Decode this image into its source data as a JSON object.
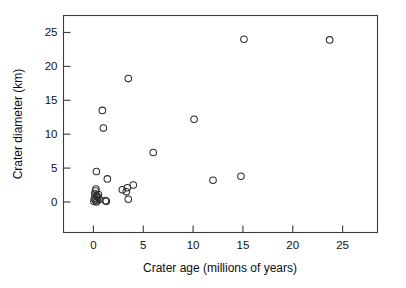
{
  "chart_data": {
    "type": "scatter",
    "title": "",
    "xlabel": "Crater age (millions of years)",
    "ylabel": "Crater diameter (km)",
    "xlim": [
      -3,
      28.5
    ],
    "ylim": [
      -4.5,
      27.5
    ],
    "xticks": [
      0,
      5,
      10,
      15,
      20,
      25
    ],
    "yticks": [
      0,
      5,
      10,
      15,
      20,
      25
    ],
    "xtick_labels": [
      "0",
      "5",
      "10",
      "15",
      "20",
      "25"
    ],
    "ytick_labels": [
      "0",
      "5",
      "10",
      "15",
      "20",
      "25"
    ],
    "grid": false,
    "legend": null,
    "marker": "open-circle",
    "series": [
      {
        "name": "craters",
        "points": [
          {
            "x": 15.1,
            "y": 24.0
          },
          {
            "x": 23.7,
            "y": 23.9
          },
          {
            "x": 3.5,
            "y": 18.2
          },
          {
            "x": 0.9,
            "y": 13.5
          },
          {
            "x": 1.0,
            "y": 10.9
          },
          {
            "x": 10.1,
            "y": 12.2
          },
          {
            "x": 6.0,
            "y": 7.3
          },
          {
            "x": 0.3,
            "y": 4.5
          },
          {
            "x": 1.4,
            "y": 3.4
          },
          {
            "x": 12.0,
            "y": 3.2
          },
          {
            "x": 14.8,
            "y": 3.8
          },
          {
            "x": 4.0,
            "y": 2.5
          },
          {
            "x": 3.4,
            "y": 2.1
          },
          {
            "x": 2.9,
            "y": 1.8
          },
          {
            "x": 3.3,
            "y": 1.5
          },
          {
            "x": 3.5,
            "y": 0.4
          },
          {
            "x": 1.2,
            "y": 0.2
          },
          {
            "x": 1.3,
            "y": 0.1
          },
          {
            "x": 0.25,
            "y": 1.9
          },
          {
            "x": 0.2,
            "y": 1.6
          },
          {
            "x": 0.15,
            "y": 1.2
          },
          {
            "x": 0.3,
            "y": 1.0
          },
          {
            "x": 0.35,
            "y": 0.8
          },
          {
            "x": 0.45,
            "y": 0.7
          },
          {
            "x": 0.5,
            "y": 1.1
          },
          {
            "x": 0.1,
            "y": 0.5
          },
          {
            "x": 0.2,
            "y": 0.3
          },
          {
            "x": 0.4,
            "y": 0.2
          },
          {
            "x": 0.05,
            "y": 0.1
          },
          {
            "x": 0.3,
            "y": 0.0
          },
          {
            "x": 0.6,
            "y": 0.4
          }
        ]
      }
    ]
  },
  "axes": {
    "x_title": "Crater age (millions of years)",
    "y_title": "Crater diameter (km)"
  }
}
